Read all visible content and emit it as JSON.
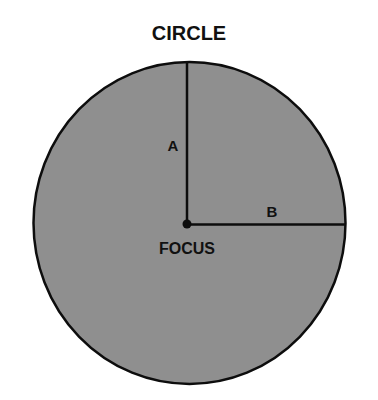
{
  "title": "CIRCLE",
  "labels": {
    "a": "A",
    "b": "B",
    "focus": "FOCUS"
  },
  "colors": {
    "fill": "#8f8f8f",
    "stroke": "#0d0d0d",
    "text": "#111111",
    "background": "#ffffff"
  },
  "shape": {
    "type": "circle",
    "center": [
      189,
      223
    ],
    "radius_x": 156,
    "radius_y": 161,
    "focus": [
      187,
      223
    ]
  }
}
